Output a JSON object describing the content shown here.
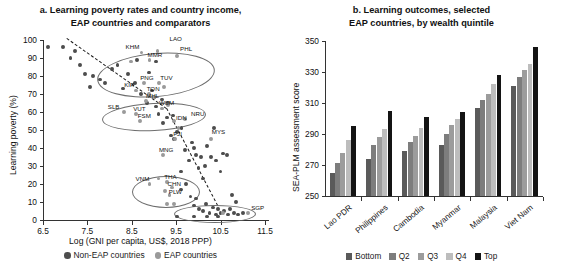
{
  "chart_data": [
    {
      "type": "scatter",
      "panel": "a",
      "title": "a. Learning poverty rates and country income,",
      "title_line2": "EAP countries and comparators",
      "xlabel": "Log (GNI per capita, US$, 2018 PPP)",
      "ylabel": "Learning poverty (%)",
      "xlim": [
        6.5,
        11.5
      ],
      "ylim": [
        0,
        100
      ],
      "xticks": [
        "6.5",
        "7.5",
        "8.5",
        "9.5",
        "10.5",
        "11.5"
      ],
      "yticks": [
        "0",
        "10",
        "20",
        "30",
        "40",
        "50",
        "60",
        "70",
        "80",
        "90",
        "100"
      ],
      "grid": false,
      "legend_position": "below-axis",
      "legend": [
        {
          "label": "Non-EAP countries",
          "series": "non",
          "color": "#4d4d4d"
        },
        {
          "label": "EAP countries",
          "series": "eap",
          "color": "#9a9a9a"
        }
      ],
      "annotations": [
        "LAO",
        "KHM",
        "MMR",
        "PHL",
        "PNG",
        "TUV",
        "KIR",
        "TON",
        "MHL",
        "SLB",
        "VUT",
        "WSM",
        "FSM",
        "IDN",
        "NRU",
        "FJI",
        "MYS",
        "MNG",
        "VNM",
        "THA",
        "CHN",
        "PLW",
        "SGP"
      ],
      "points_non": [
        [
          6.62,
          96
        ],
        [
          6.95,
          96
        ],
        [
          7.12,
          90
        ],
        [
          7.22,
          94
        ],
        [
          7.33,
          86
        ],
        [
          7.45,
          81
        ],
        [
          7.55,
          74
        ],
        [
          7.62,
          80
        ],
        [
          7.78,
          78
        ],
        [
          7.9,
          76
        ],
        [
          8.05,
          84
        ],
        [
          8.18,
          86
        ],
        [
          8.3,
          73
        ],
        [
          8.42,
          81
        ],
        [
          8.58,
          76
        ],
        [
          8.7,
          70
        ],
        [
          8.85,
          65
        ],
        [
          8.95,
          72
        ],
        [
          9.05,
          63
        ],
        [
          9.1,
          59
        ],
        [
          9.2,
          54
        ],
        [
          9.3,
          57
        ],
        [
          9.38,
          47
        ],
        [
          9.45,
          45
        ],
        [
          9.52,
          49
        ],
        [
          9.6,
          27
        ],
        [
          9.62,
          51
        ],
        [
          9.7,
          39
        ],
        [
          9.78,
          33
        ],
        [
          9.85,
          43
        ],
        [
          9.9,
          40
        ],
        [
          9.95,
          36
        ],
        [
          10.0,
          29
        ],
        [
          10.05,
          35
        ],
        [
          10.1,
          23
        ],
        [
          10.15,
          30
        ],
        [
          10.2,
          41
        ],
        [
          10.28,
          35
        ],
        [
          10.35,
          51
        ],
        [
          10.4,
          33
        ],
        [
          10.5,
          27
        ],
        [
          10.55,
          37
        ],
        [
          10.65,
          36
        ],
        [
          10.75,
          14
        ],
        [
          10.85,
          10
        ],
        [
          9.6,
          17
        ],
        [
          9.72,
          20
        ],
        [
          9.82,
          13
        ],
        [
          9.9,
          8
        ],
        [
          9.95,
          12
        ],
        [
          10.02,
          6
        ],
        [
          10.1,
          5
        ],
        [
          10.18,
          9
        ],
        [
          10.25,
          4
        ],
        [
          10.32,
          7
        ],
        [
          10.4,
          3
        ],
        [
          10.45,
          6
        ],
        [
          10.5,
          4
        ],
        [
          10.58,
          5
        ],
        [
          10.66,
          3
        ],
        [
          10.72,
          6
        ],
        [
          10.8,
          4
        ],
        [
          10.9,
          3
        ],
        [
          11.0,
          4
        ],
        [
          9.52,
          2
        ],
        [
          9.9,
          2
        ],
        [
          10.2,
          2
        ],
        [
          10.45,
          2
        ],
        [
          8.88,
          82
        ],
        [
          9.0,
          68
        ],
        [
          9.18,
          67
        ],
        [
          9.32,
          65
        ],
        [
          9.05,
          88
        ],
        [
          8.62,
          89
        ],
        [
          9.42,
          58
        ]
      ],
      "points_eap": [
        [
          9.08,
          94
        ],
        [
          8.72,
          93
        ],
        [
          9.52,
          91
        ],
        [
          8.9,
          89
        ],
        [
          8.48,
          88
        ],
        [
          8.78,
          76
        ],
        [
          9.12,
          76
        ],
        [
          9.22,
          74
        ],
        [
          8.6,
          72
        ],
        [
          8.88,
          70
        ],
        [
          9.0,
          68
        ],
        [
          8.82,
          66
        ],
        [
          9.32,
          64
        ],
        [
          8.32,
          60
        ],
        [
          8.6,
          59
        ],
        [
          9.18,
          62
        ],
        [
          8.68,
          55
        ],
        [
          9.45,
          55
        ],
        [
          9.7,
          56
        ],
        [
          9.55,
          51
        ],
        [
          9.48,
          45
        ],
        [
          9.2,
          36
        ],
        [
          9.1,
          23
        ],
        [
          8.9,
          20
        ],
        [
          9.3,
          21
        ],
        [
          9.4,
          18
        ],
        [
          9.25,
          16
        ],
        [
          9.35,
          14
        ],
        [
          9.45,
          9
        ],
        [
          9.3,
          9
        ],
        [
          10.55,
          4
        ],
        [
          11.12,
          4
        ],
        [
          10.28,
          45
        ]
      ],
      "labeled_points": [
        {
          "name": "LAO",
          "x": 9.35,
          "y": 98,
          "dx": 0,
          "dy": 0
        },
        {
          "name": "KHM",
          "x": 8.72,
          "y": 93,
          "dx": -16,
          "dy": -1
        },
        {
          "name": "MMR",
          "x": 8.9,
          "y": 89,
          "dx": -2,
          "dy": 0
        },
        {
          "name": "PHL",
          "x": 9.52,
          "y": 91,
          "dx": 3,
          "dy": -2
        },
        {
          "name": "PNG",
          "x": 8.78,
          "y": 76,
          "dx": -4,
          "dy": 0
        },
        {
          "name": "TUV",
          "x": 9.12,
          "y": 76,
          "dx": 1,
          "dy": 0
        },
        {
          "name": "KIR",
          "x": 8.6,
          "y": 72,
          "dx": -12,
          "dy": 0
        },
        {
          "name": "TON",
          "x": 8.88,
          "y": 70,
          "dx": -2,
          "dy": 0
        },
        {
          "name": "MHL",
          "x": 8.82,
          "y": 66,
          "dx": 0,
          "dy": 0
        },
        {
          "name": "SLB",
          "x": 8.32,
          "y": 60,
          "dx": -16,
          "dy": 0
        },
        {
          "name": "VUT",
          "x": 8.6,
          "y": 59,
          "dx": -3,
          "dy": 0
        },
        {
          "name": "WSM",
          "x": 9.18,
          "y": 62,
          "dx": -3,
          "dy": 0
        },
        {
          "name": "FSM",
          "x": 8.68,
          "y": 55,
          "dx": -2,
          "dy": 0
        },
        {
          "name": "IDN",
          "x": 9.45,
          "y": 55,
          "dx": 2,
          "dy": 2
        },
        {
          "name": "NRU",
          "x": 9.7,
          "y": 56,
          "dx": 6,
          "dy": 0
        },
        {
          "name": "FJI",
          "x": 9.48,
          "y": 45,
          "dx": -2,
          "dy": 0
        },
        {
          "name": "MYS",
          "x": 10.28,
          "y": 45,
          "dx": 1,
          "dy": -2
        },
        {
          "name": "MNG",
          "x": 9.2,
          "y": 36,
          "dx": -4,
          "dy": 0
        },
        {
          "name": "VNM",
          "x": 8.9,
          "y": 20,
          "dx": -14,
          "dy": 0
        },
        {
          "name": "THA",
          "x": 9.3,
          "y": 21,
          "dx": -3,
          "dy": 0
        },
        {
          "name": "CHN",
          "x": 9.35,
          "y": 17,
          "dx": -2,
          "dy": 0
        },
        {
          "name": "PLW",
          "x": 9.38,
          "y": 13,
          "dx": -2,
          "dy": 0
        },
        {
          "name": "SGP",
          "x": 11.12,
          "y": 4,
          "dx": 3,
          "dy": 0
        }
      ]
    },
    {
      "type": "bar",
      "panel": "b",
      "title": "b. Learning outcomes, selected",
      "title_line2": "EAP countries, by wealth quintile",
      "xlabel": "",
      "ylabel": "SEA-PLM assessment score",
      "ylim": [
        250,
        350
      ],
      "yticks": [
        "250",
        "270",
        "290",
        "310",
        "330",
        "350"
      ],
      "grid": false,
      "legend_position": "bottom",
      "categories": [
        "Lao PDR",
        "Philippines",
        "Cambodia",
        "Myanmar",
        "Malaysia",
        "Viet Nam"
      ],
      "series": [
        {
          "name": "Bottom",
          "color": "#5a5a5a",
          "values": [
            265,
            274,
            279,
            283,
            307,
            321
          ]
        },
        {
          "name": "Q2",
          "color": "#7d7d7d",
          "values": [
            271,
            283,
            285,
            290,
            312,
            327
          ]
        },
        {
          "name": "Q3",
          "color": "#9c9c9c",
          "values": [
            278,
            288,
            289,
            296,
            316,
            331
          ]
        },
        {
          "name": "Q4",
          "color": "#bdbdbd",
          "values": [
            286,
            293,
            294,
            300,
            322,
            335
          ]
        },
        {
          "name": "Top",
          "color": "#141414",
          "values": [
            295,
            305,
            301,
            304,
            328,
            346
          ]
        }
      ]
    }
  ]
}
